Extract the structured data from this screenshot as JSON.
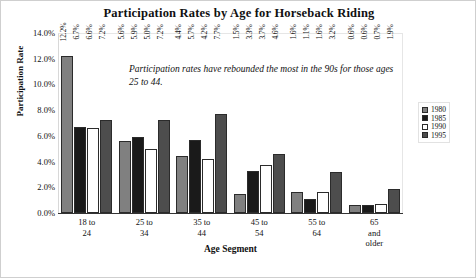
{
  "chart_data": {
    "type": "bar",
    "title": "Participation Rates by Age for Horseback Riding",
    "xlabel": "Age Segment",
    "ylabel": "Participation Rate",
    "ylim": [
      0,
      14
    ],
    "ytick_labels": [
      "14.0%",
      "12.0%",
      "10.0%",
      "8.0%",
      "6.0%",
      "4.0%",
      "2.0%",
      "0.0%"
    ],
    "ytick_values": [
      14,
      12,
      10,
      8,
      6,
      4,
      2,
      0
    ],
    "grid": false,
    "legend_position": "right",
    "categories": [
      "18 to 24",
      "25 to 34",
      "35 to 44",
      "45 to 54",
      "55 to 64",
      "65 and older"
    ],
    "category_lines": [
      [
        "18 to",
        "24"
      ],
      [
        "25 to",
        "34"
      ],
      [
        "35 to",
        "44"
      ],
      [
        "45 to",
        "54"
      ],
      [
        "55 to",
        "64"
      ],
      [
        "65",
        "and",
        "older"
      ]
    ],
    "series": [
      {
        "name": "1980",
        "color": "#808080",
        "values": [
          12.2,
          5.6,
          4.4,
          1.5,
          1.6,
          0.6
        ],
        "labels": [
          "12.2%",
          "5.6%",
          "4.4%",
          "1.5%",
          "1.6%",
          "0.6%"
        ]
      },
      {
        "name": "1985",
        "color": "#1a1a1a",
        "values": [
          6.7,
          5.9,
          5.7,
          3.3,
          1.1,
          0.6
        ],
        "labels": [
          "6.7%",
          "5.9%",
          "5.7%",
          "3.3%",
          "1.1%",
          "0.6%"
        ]
      },
      {
        "name": "1990",
        "color": "#ffffff",
        "values": [
          6.6,
          5.0,
          4.2,
          3.7,
          1.6,
          0.7
        ],
        "labels": [
          "6.6%",
          "5.0%",
          "4.2%",
          "3.7%",
          "1.6%",
          "0.7%"
        ]
      },
      {
        "name": "1995",
        "color": "#4d4d4d",
        "values": [
          7.2,
          7.2,
          7.7,
          4.6,
          3.2,
          1.9
        ],
        "labels": [
          "7.2%",
          "7.2%",
          "7.7%",
          "4.6%",
          "3.2%",
          "1.9%"
        ]
      }
    ],
    "annotations": [
      "Participation rates have rebounded the most in the 90s for those ages 25 to 44."
    ]
  }
}
